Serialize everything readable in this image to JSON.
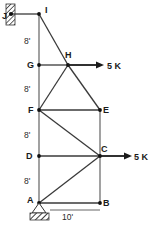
{
  "figure": {
    "type": "structural-truss-diagram",
    "title": "",
    "joints": [
      {
        "id": "J",
        "label": "J",
        "x": 10,
        "y": 14,
        "label_x": 2,
        "label_y": 18,
        "marker": false
      },
      {
        "id": "I",
        "label": "I",
        "x": 39,
        "y": 14,
        "label_x": 45,
        "label_y": 13,
        "marker": true
      },
      {
        "id": "G",
        "label": "G",
        "x": 39,
        "y": 65,
        "label_x": 28,
        "label_y": 68,
        "marker": true
      },
      {
        "id": "H",
        "label": "H",
        "x": 68,
        "y": 65,
        "label_x": 66,
        "label_y": 58,
        "marker": true
      },
      {
        "id": "F",
        "label": "F",
        "x": 39,
        "y": 110,
        "label_x": 28,
        "label_y": 113,
        "marker": true
      },
      {
        "id": "E",
        "label": "E",
        "x": 100,
        "y": 110,
        "label_x": 103,
        "label_y": 113,
        "marker": true
      },
      {
        "id": "D",
        "label": "D",
        "x": 39,
        "y": 156,
        "label_x": 27,
        "label_y": 159,
        "marker": true
      },
      {
        "id": "C",
        "label": "C",
        "x": 100,
        "y": 156,
        "label_x": 101,
        "label_y": 152,
        "marker": true
      },
      {
        "id": "A",
        "label": "A",
        "x": 39,
        "y": 203,
        "label_x": 28,
        "label_y": 203,
        "marker": true
      },
      {
        "id": "B",
        "label": "B",
        "x": 100,
        "y": 203,
        "label_x": 103,
        "label_y": 206,
        "marker": true
      }
    ],
    "members": [
      {
        "name": "member-J-I",
        "from": "J",
        "to": "I"
      },
      {
        "name": "member-I-G",
        "from": "I",
        "to": "G"
      },
      {
        "name": "member-G-F",
        "from": "G",
        "to": "F"
      },
      {
        "name": "member-F-D",
        "from": "F",
        "to": "D"
      },
      {
        "name": "member-D-A",
        "from": "D",
        "to": "A"
      },
      {
        "name": "member-I-H",
        "from": "I",
        "to": "H"
      },
      {
        "name": "member-G-H",
        "from": "G",
        "to": "H"
      },
      {
        "name": "member-H-F",
        "from": "H",
        "to": "F"
      },
      {
        "name": "member-H-E",
        "from": "H",
        "to": "E"
      },
      {
        "name": "member-F-E",
        "from": "F",
        "to": "E"
      },
      {
        "name": "member-F-C",
        "from": "F",
        "to": "C"
      },
      {
        "name": "member-E-C",
        "from": "E",
        "to": "C"
      },
      {
        "name": "member-D-C",
        "from": "D",
        "to": "C"
      },
      {
        "name": "member-A-C",
        "from": "A",
        "to": "C"
      },
      {
        "name": "member-C-B",
        "from": "C",
        "to": "B"
      },
      {
        "name": "member-A-B",
        "from": "A",
        "to": "B"
      }
    ],
    "loads": [
      {
        "name": "load-at-H",
        "label": "5 K",
        "magnitude": 5,
        "unit": "K",
        "at_joint": "H",
        "direction": "right",
        "x1": 68,
        "y1": 65,
        "x2": 103,
        "y2": 65,
        "label_x": 107,
        "label_y": 69
      },
      {
        "name": "load-at-C",
        "label": "5 K",
        "magnitude": 5,
        "unit": "K",
        "at_joint": "C",
        "direction": "right",
        "x1": 100,
        "y1": 156,
        "x2": 131,
        "y2": 156,
        "label_x": 134,
        "label_y": 160
      }
    ],
    "dimensions": [
      {
        "name": "dim-I-G",
        "label": "8'",
        "value": 8,
        "unit": "ft",
        "x": 24,
        "y": 43
      },
      {
        "name": "dim-G-F",
        "label": "8'",
        "value": 8,
        "unit": "ft",
        "x": 24,
        "y": 91
      },
      {
        "name": "dim-F-D",
        "label": "8'",
        "value": 8,
        "unit": "ft",
        "x": 24,
        "y": 137
      },
      {
        "name": "dim-D-A",
        "label": "8'",
        "value": 8,
        "unit": "ft",
        "x": 24,
        "y": 183
      },
      {
        "name": "dim-A-B",
        "label": "10'",
        "value": 10,
        "unit": "ft",
        "x": 63,
        "y": 218
      }
    ],
    "supports": [
      {
        "name": "wall-support-J",
        "kind": "fixed-wall",
        "at_joint": "J",
        "x": 6,
        "y": 4,
        "width": 9,
        "height": 21
      },
      {
        "name": "pin-support-A",
        "kind": "pin",
        "at_joint": "A",
        "tri_x": 39,
        "tri_y": 203,
        "tri_half_width": 7,
        "tri_height": 10,
        "base_x": 30,
        "base_y": 214,
        "base_width": 19,
        "base_height": 7
      }
    ],
    "colors": {
      "member": "#3a3a3a",
      "joint": "#111111",
      "label": "#1a1a1a",
      "background": "#ffffff",
      "hatch": "#333333"
    }
  }
}
